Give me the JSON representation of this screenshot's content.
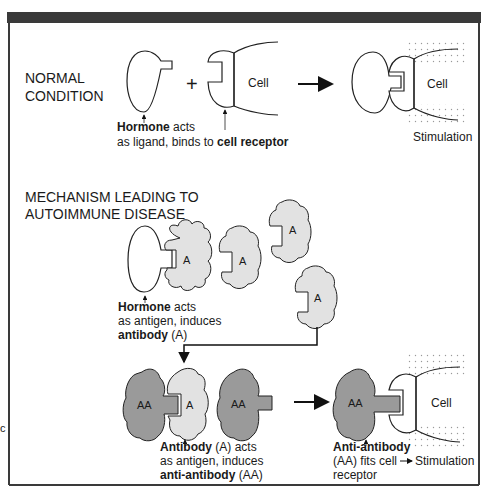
{
  "colors": {
    "frame_bar": "#3a3a3a",
    "frame_border": "#3a3a3a",
    "stroke": "#222222",
    "antibody_fill": "#e2e2e2",
    "anti_antibody_fill": "#9a9a9a",
    "background": "#ffffff"
  },
  "normal": {
    "heading_line1": "NORMAL",
    "heading_line2": "CONDITION",
    "plus": "+",
    "cell_label": "Cell",
    "cell_label_result": "Cell",
    "caption_bold1": "Hormone",
    "caption_rest1": " acts",
    "caption_line2a": "as ligand, binds to ",
    "caption_bold2": "cell receptor",
    "stimulation": "Stimulation"
  },
  "autoimmune": {
    "heading_line1": "MECHANISM LEADING TO",
    "heading_line2": "AUTOIMMUNE DISEASE",
    "antibody_letter": "A",
    "anti_antibody_letters": "AA",
    "hormone_caption": {
      "bold": "Hormone",
      "rest": " acts",
      "line2": "as antigen, induces",
      "line3_bold": "antibody",
      "line3_rest": " (A)"
    },
    "antibody_caption": {
      "bold": "Antibody",
      "rest": " (A) acts",
      "line2": "as antigen, induces",
      "line3_bold": "anti-antibody",
      "line3_rest": " (AA)"
    },
    "anti_antibody_caption": {
      "bold": "Anti-antibody",
      "line2": "(AA) fits cell",
      "line3": "receptor"
    },
    "stimulation": "Stimulation",
    "cell_label": "Cell"
  },
  "margin_marker": "c"
}
